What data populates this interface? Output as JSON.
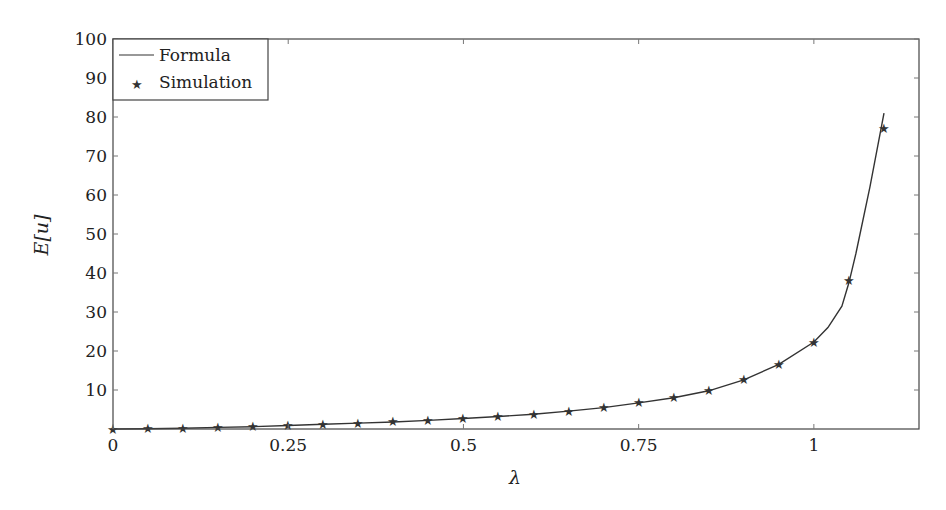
{
  "chart_data": {
    "type": "line",
    "title": "",
    "xlabel": "λ",
    "ylabel": "E[u]",
    "xlim": [
      0,
      1.15
    ],
    "ylim": [
      0,
      100
    ],
    "x_ticks": [
      0,
      0.25,
      0.5,
      0.75,
      1
    ],
    "x_tick_labels": [
      "0",
      "0.25",
      "0.5",
      "0.75",
      "1"
    ],
    "y_ticks": [
      10,
      20,
      30,
      40,
      50,
      60,
      70,
      80,
      90,
      100
    ],
    "y_tick_labels": [
      "10",
      "20",
      "30",
      "40",
      "50",
      "60",
      "70",
      "80",
      "90",
      "100"
    ],
    "grid": false,
    "legend_position": "upper left",
    "series": [
      {
        "name": "Formula",
        "style": "solid line",
        "x": [
          0,
          0.05,
          0.1,
          0.15,
          0.2,
          0.25,
          0.3,
          0.35,
          0.4,
          0.45,
          0.5,
          0.55,
          0.6,
          0.65,
          0.7,
          0.75,
          0.8,
          0.85,
          0.9,
          0.95,
          1.0,
          1.02,
          1.04,
          1.05,
          1.06,
          1.08,
          1.1
        ],
        "values": [
          0,
          0.05,
          0.2,
          0.4,
          0.6,
          0.9,
          1.2,
          1.5,
          1.8,
          2.2,
          2.7,
          3.2,
          3.8,
          4.6,
          5.5,
          6.7,
          8.0,
          9.8,
          12.6,
          16.6,
          22.3,
          26.0,
          31.5,
          37.5,
          45.0,
          62.0,
          81.0
        ]
      },
      {
        "name": "Simulation",
        "style": "star markers",
        "x": [
          0,
          0.05,
          0.1,
          0.15,
          0.2,
          0.25,
          0.3,
          0.35,
          0.4,
          0.45,
          0.5,
          0.55,
          0.6,
          0.65,
          0.7,
          0.75,
          0.8,
          0.85,
          0.9,
          0.95,
          1.0,
          1.05,
          1.1
        ],
        "values": [
          0,
          0.05,
          0.2,
          0.4,
          0.6,
          0.9,
          1.2,
          1.5,
          1.8,
          2.2,
          2.7,
          3.2,
          3.8,
          4.6,
          5.5,
          6.7,
          8.0,
          9.8,
          12.6,
          16.6,
          22.3,
          38.2,
          77.0
        ]
      }
    ]
  },
  "legend": {
    "items": [
      {
        "label": "Formula",
        "icon": "line-swatch"
      },
      {
        "label": "Simulation",
        "icon": "star-marker"
      }
    ]
  },
  "colors": {
    "line": "#333333",
    "frame": "#444444",
    "text": "#222222"
  }
}
